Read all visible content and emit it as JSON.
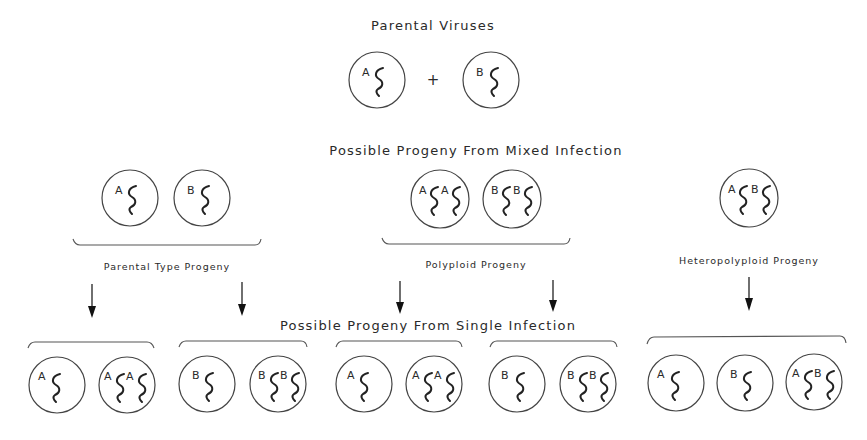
{
  "title": "Parental Viruses",
  "plus_sign": "+",
  "parental": [
    {
      "genomes": [
        "A"
      ]
    },
    {
      "genomes": [
        "B"
      ]
    }
  ],
  "mixed_infection": {
    "heading": "Possible Progeny From Mixed Infection",
    "groups": [
      {
        "label": "Parental Type Progeny",
        "viruses": [
          {
            "genomes": [
              "A"
            ]
          },
          {
            "genomes": [
              "B"
            ]
          }
        ]
      },
      {
        "label": "Polyploid Progeny",
        "viruses": [
          {
            "genomes": [
              "A",
              "A"
            ]
          },
          {
            "genomes": [
              "B",
              "B"
            ]
          }
        ]
      },
      {
        "label": "Heteropolyploid Progeny",
        "viruses": [
          {
            "genomes": [
              "A",
              "B"
            ]
          }
        ]
      }
    ]
  },
  "single_infection": {
    "heading": "Possible Progeny From Single Infection",
    "groups": [
      {
        "viruses": [
          {
            "genomes": [
              "A"
            ]
          },
          {
            "genomes": [
              "A",
              "A"
            ]
          }
        ]
      },
      {
        "viruses": [
          {
            "genomes": [
              "B"
            ]
          },
          {
            "genomes": [
              "B",
              "B"
            ]
          }
        ]
      },
      {
        "viruses": [
          {
            "genomes": [
              "A"
            ]
          },
          {
            "genomes": [
              "A",
              "A"
            ]
          }
        ]
      },
      {
        "viruses": [
          {
            "genomes": [
              "B"
            ]
          },
          {
            "genomes": [
              "B",
              "B"
            ]
          }
        ]
      },
      {
        "viruses": [
          {
            "genomes": [
              "A"
            ]
          },
          {
            "genomes": [
              "B"
            ]
          },
          {
            "genomes": [
              "A",
              "B"
            ]
          }
        ]
      }
    ]
  },
  "colors": {
    "ink": "#222222",
    "background": "#ffffff"
  }
}
